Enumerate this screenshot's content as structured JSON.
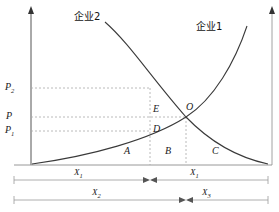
{
  "figure": {
    "type": "economics-supply-demand-diagram",
    "background_color": "#ffffff",
    "curve_color": "#3a3a3a",
    "dash_color": "#a8a8a8",
    "axis_color": "#555555",
    "text_color": "#1a1a1a"
  },
  "curves": {
    "firm1": {
      "label": "企业1",
      "meaning": "upward-sloping-curve-enterprise-1",
      "label_x": 196,
      "label_y": 22
    },
    "firm2": {
      "label": "企业2",
      "meaning": "downward-sloping-curve-enterprise-2",
      "label_x": 74,
      "label_y": 12
    }
  },
  "price_axis": {
    "name": "vertical-price-axis",
    "ticks": [
      {
        "label": "P",
        "subscript": "2",
        "y": 88
      },
      {
        "label": "P",
        "subscript": "",
        "y": 117
      },
      {
        "label": "P",
        "subscript": "1",
        "y": 131
      }
    ]
  },
  "points": [
    {
      "label": "O",
      "x": 186,
      "y": 108,
      "meaning": "equilibrium-intersection-point"
    },
    {
      "label": "E",
      "x": 152,
      "y": 110,
      "meaning": "point-on-upper-dashed-line"
    },
    {
      "label": "D",
      "x": 152,
      "y": 128,
      "meaning": "point-on-lower-dashed-line"
    }
  ],
  "regions": [
    {
      "label": "A",
      "x": 124,
      "y": 150
    },
    {
      "label": "B",
      "x": 165,
      "y": 150
    },
    {
      "label": "C",
      "x": 212,
      "y": 150
    }
  ],
  "quantity_spans": [
    {
      "label": "X",
      "subscript": "1",
      "x": 78,
      "y": 170,
      "row": 1,
      "meaning": "quantity-x1-span"
    },
    {
      "label": "X",
      "subscript": "1",
      "x": 190,
      "y": 170,
      "row": 1,
      "meaning": "quantity-x1-prime-span"
    },
    {
      "label": "X",
      "subscript": "2",
      "x": 95,
      "y": 189,
      "row": 2,
      "meaning": "quantity-x2-span"
    },
    {
      "label": "X",
      "subscript": "3",
      "x": 205,
      "y": 189,
      "row": 2,
      "meaning": "quantity-x3-span"
    }
  ]
}
